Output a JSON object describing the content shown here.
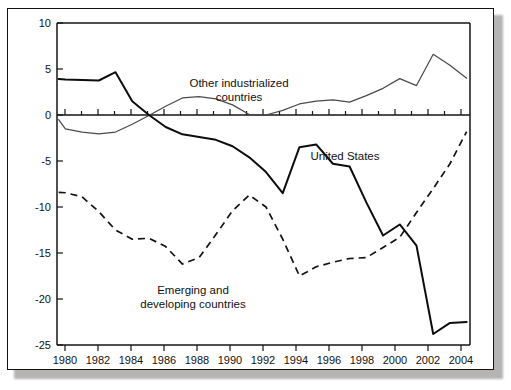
{
  "figure": {
    "frame_border_color": "#121212",
    "background_color": "#ffffff",
    "shadow_color": "#a9a8a6"
  },
  "axes": {
    "y_tick_labels": [
      "10",
      "5",
      "0",
      "-5",
      "-10",
      "-15",
      "-20",
      "-25"
    ],
    "x_tick_labels": [
      "1980",
      "1982",
      "1984",
      "1986",
      "1988",
      "1990",
      "1992",
      "1994",
      "1996",
      "1998",
      "2000",
      "2002",
      "2004"
    ]
  },
  "annotations": {
    "other_industrialized_line1": "Other industrialized",
    "other_industrialized_line2": "countries",
    "united_states": "United States",
    "emerging_line1": "Emerging and",
    "emerging_line2": "developing countries"
  },
  "chart_data": {
    "type": "line",
    "title": "",
    "xlabel": "",
    "ylabel": "",
    "xlim": [
      1979.5,
      2004.2
    ],
    "ylim": [
      -25,
      10
    ],
    "grid": false,
    "legend": "inline-annotations",
    "y_ticks": [
      10,
      5,
      0,
      -5,
      -10,
      -15,
      -20,
      -25
    ],
    "x_ticks": [
      1980,
      1982,
      1984,
      1986,
      1988,
      1990,
      1992,
      1994,
      1996,
      1998,
      2000,
      2002,
      2004
    ],
    "x_minor_ticks": [
      1981,
      1983,
      1985,
      1987,
      1989,
      1991,
      1993,
      1995,
      1997,
      1999,
      2001,
      2003
    ],
    "x": [
      1979.6,
      1980,
      1981,
      1982,
      1983,
      1984,
      1985,
      1986,
      1987,
      1988,
      1989,
      1990,
      1991,
      1992,
      1993,
      1994,
      1995,
      1996,
      1997,
      1998,
      1999,
      2000,
      2001,
      2002,
      2003,
      2004
    ],
    "series": [
      {
        "name": "United States",
        "style": "solid-bold",
        "color": "#0d0d0d",
        "values": [
          3.9,
          3.85,
          3.8,
          3.75,
          4.65,
          1.5,
          0.0,
          -1.3,
          -2.1,
          -2.4,
          -2.7,
          -3.4,
          -4.6,
          -6.2,
          -8.5,
          -3.5,
          -3.2,
          -5.3,
          -5.6,
          -9.5,
          -13.1,
          -11.9,
          -14.2,
          -23.8,
          -24.3,
          -22.5
        ]
      },
      {
        "name": "Other industrialized countries",
        "style": "solid-thin",
        "color": "#4a4a4a",
        "values": [
          -0.5,
          -1.5,
          -1.85,
          -2.05,
          -1.85,
          -1.0,
          -0.05,
          0.95,
          1.85,
          2.0,
          1.75,
          1.1,
          0.05,
          0.0,
          0.5,
          1.2,
          1.5,
          1.65,
          1.4,
          2.1,
          2.9,
          3.95,
          3.2,
          2.7,
          5.6,
          9.0
        ]
      },
      {
        "name": "Emerging and developing countries",
        "style": "dashed",
        "color": "#121212",
        "values": [
          -8.4,
          -8.45,
          -8.9,
          -10.5,
          -12.5,
          -13.5,
          -13.4,
          -14.3,
          -16.2,
          -15.5,
          -13.0,
          -10.4,
          -8.7,
          -10.0,
          -13.5,
          -17.5,
          -16.5,
          -16.0,
          -15.6,
          -15.5,
          -14.4,
          -13.3,
          -15.5,
          -16.9,
          -14.0,
          -11.3
        ]
      }
    ],
    "series_tail": {
      "note": "later values continue to 2004 as listed in full_series",
      "united_states_2002_2004": [
        -24.3,
        -22.6,
        -22.5
      ],
      "other_industrialized_2001_2004": [
        9.0,
        6.6,
        5.4,
        4.0
      ],
      "emerging_2000_2004": [
        -11.3,
        -10.6,
        -8.0,
        -5.3,
        -1.8
      ]
    },
    "full_series": {
      "x": [
        1979.6,
        1980,
        1981,
        1982,
        1983,
        1984,
        1985,
        1986,
        1987,
        1988,
        1989,
        1990,
        1991,
        1992,
        1993,
        1994,
        1995,
        1996,
        1997,
        1998,
        1999,
        2000,
        2001,
        2002,
        2003,
        2004
      ],
      "united_states": [
        3.9,
        3.85,
        3.8,
        3.75,
        4.65,
        1.5,
        0.0,
        -1.3,
        -2.1,
        -2.4,
        -2.7,
        -3.4,
        -4.6,
        -6.2,
        -8.5,
        -3.5,
        -3.2,
        -5.3,
        -5.6,
        -9.5,
        -13.1,
        -11.9,
        -14.2,
        -23.8,
        -24.3,
        -22.5
      ],
      "other_industrialized": [
        -0.5,
        -1.5,
        -1.85,
        -2.05,
        -1.85,
        -1.0,
        -0.05,
        0.95,
        1.85,
        2.0,
        1.75,
        1.1,
        0.05,
        0.0,
        0.5,
        1.2,
        1.5,
        1.65,
        1.4,
        2.1,
        2.9,
        3.95,
        3.2,
        2.7,
        5.6,
        9.0
      ],
      "emerging_developing": [
        -8.4,
        -8.45,
        -8.9,
        -10.5,
        -12.5,
        -13.5,
        -13.4,
        -14.3,
        -16.2,
        -15.5,
        -13.0,
        -10.4,
        -8.7,
        -10.0,
        -13.5,
        -17.5,
        -16.5,
        -16.0,
        -15.6,
        -15.5,
        -14.4,
        -13.3,
        -15.5,
        -16.9,
        -14.0,
        -11.3
      ]
    }
  }
}
